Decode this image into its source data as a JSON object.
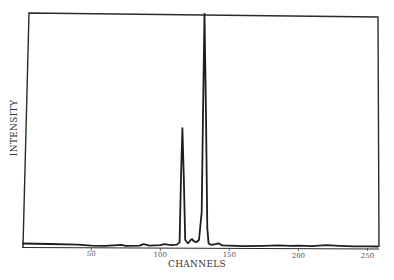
{
  "chart_data": {
    "type": "line",
    "title": "",
    "xlabel": "CHANNELS",
    "ylabel": "INTENSITY",
    "xlim": [
      0,
      258
    ],
    "ylim": [
      0,
      100
    ],
    "x_ticks": [
      50,
      100,
      150,
      200,
      250
    ],
    "x_tick_labels": [
      "50",
      "100",
      "150",
      "200",
      "250"
    ],
    "y_ticks": [],
    "grid": false,
    "legend": null,
    "series": [
      {
        "name": "spectrum",
        "points": [
          [
            0,
            1.5
          ],
          [
            20,
            1.3
          ],
          [
            40,
            1.0
          ],
          [
            50,
            0.6
          ],
          [
            60,
            0.5
          ],
          [
            72,
            0.9
          ],
          [
            75,
            0.5
          ],
          [
            85,
            0.6
          ],
          [
            88,
            1.2
          ],
          [
            92,
            0.6
          ],
          [
            100,
            0.8
          ],
          [
            103,
            1.2
          ],
          [
            108,
            0.8
          ],
          [
            112,
            1.0
          ],
          [
            114,
            2.0
          ],
          [
            115,
            30
          ],
          [
            116,
            51
          ],
          [
            117,
            30
          ],
          [
            118,
            3.0
          ],
          [
            120,
            1.6
          ],
          [
            122,
            3.0
          ],
          [
            123,
            3.4
          ],
          [
            124,
            2.6
          ],
          [
            126,
            2.0
          ],
          [
            128,
            3.0
          ],
          [
            130,
            15
          ],
          [
            131,
            60
          ],
          [
            132,
            100
          ],
          [
            133,
            60
          ],
          [
            134,
            8
          ],
          [
            135,
            1.5
          ],
          [
            137,
            0.9
          ],
          [
            140,
            1.2
          ],
          [
            142,
            1.6
          ],
          [
            145,
            0.7
          ],
          [
            150,
            0.6
          ],
          [
            160,
            0.4
          ],
          [
            175,
            0.5
          ],
          [
            185,
            0.7
          ],
          [
            195,
            0.5
          ],
          [
            200,
            0.6
          ],
          [
            210,
            0.4
          ],
          [
            220,
            0.8
          ],
          [
            230,
            0.5
          ],
          [
            240,
            0.3
          ],
          [
            250,
            0.3
          ],
          [
            258,
            0.2
          ]
        ]
      }
    ],
    "annotations": [
      {
        "label": "peak",
        "channel": 116,
        "relative_intensity": 51
      },
      {
        "label": "peak",
        "channel": 132,
        "relative_intensity": 100
      },
      {
        "label": "minor peak",
        "channel": 123,
        "relative_intensity": 3
      }
    ]
  },
  "labels": {
    "x_axis": "CHANNELS",
    "y_axis": "INTENSITY"
  }
}
